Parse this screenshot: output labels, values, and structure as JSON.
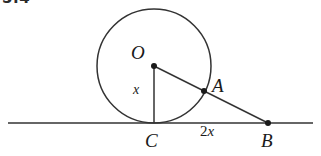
{
  "figure": {
    "problem_number": "5.4",
    "background_color": "#ffffff",
    "stroke_color": "#333333",
    "label_color": "#1a1a1a",
    "labels": {
      "center": "O",
      "tangent_point_circle": "A",
      "external_point": "B",
      "tangent_point_line": "C",
      "radius_length": "x",
      "segment_length_prefix": "2",
      "segment_length_var": "x"
    },
    "circle": {
      "center_x": 154,
      "center_y": 66,
      "radius": 57
    },
    "points": {
      "O": {
        "x": 154,
        "y": 66
      },
      "A": {
        "x": 204,
        "y": 91
      },
      "B": {
        "x": 268,
        "y": 123
      },
      "C": {
        "x": 154,
        "y": 123
      }
    },
    "baseline": {
      "x1": 8,
      "x2": 313,
      "y": 123
    },
    "segments": [
      {
        "name": "radius-OC",
        "from": "O",
        "to": "C",
        "label": "x"
      },
      {
        "name": "line-OB",
        "from": "O",
        "to": "B",
        "label": ""
      },
      {
        "name": "segment-CB",
        "from": "C",
        "to": "B",
        "label": "2x"
      }
    ]
  }
}
